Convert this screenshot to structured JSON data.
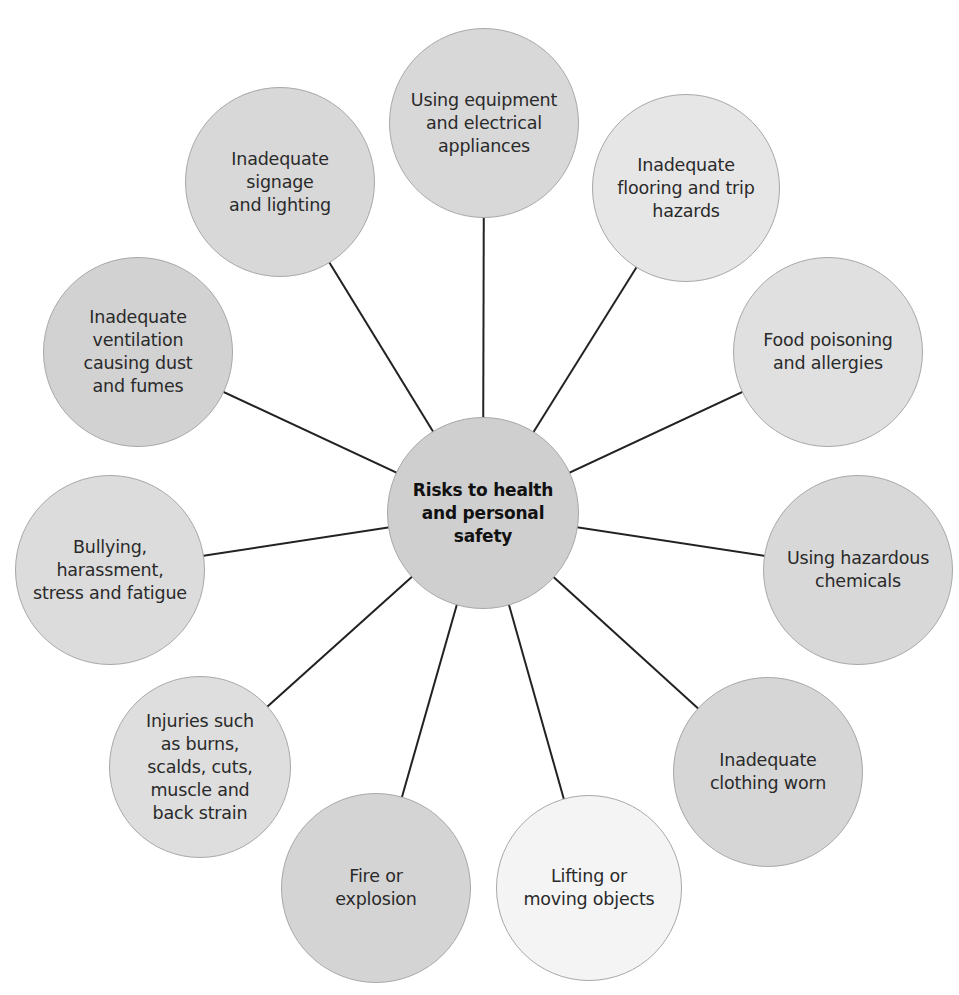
{
  "diagram": {
    "title": "Risks to health and personal safety",
    "center": {
      "label": "Risks to health\nand personal\nsafety",
      "x": 483,
      "y": 513,
      "r": 96,
      "fill": "#cfcfcf"
    },
    "line_color": "#222222",
    "nodes": [
      {
        "id": "equipment",
        "label": "Using equipment\nand electrical\nappliances",
        "x": 484,
        "y": 123,
        "r": 95,
        "fill": "#d8d8d8"
      },
      {
        "id": "flooring",
        "label": "Inadequate\nflooring and trip\nhazards",
        "x": 686,
        "y": 188,
        "r": 94,
        "fill": "#e6e6e6"
      },
      {
        "id": "food",
        "label": "Food poisoning\nand allergies",
        "x": 828,
        "y": 352,
        "r": 95,
        "fill": "#e0e0e0"
      },
      {
        "id": "chemicals",
        "label": "Using hazardous\nchemicals",
        "x": 858,
        "y": 570,
        "r": 95,
        "fill": "#d8d8d8"
      },
      {
        "id": "clothing",
        "label": "Inadequate\nclothing worn",
        "x": 768,
        "y": 772,
        "r": 95,
        "fill": "#d6d6d6"
      },
      {
        "id": "lifting",
        "label": "Lifting or\nmoving objects",
        "x": 589,
        "y": 888,
        "r": 93,
        "fill": "#f4f4f4"
      },
      {
        "id": "fire",
        "label": "Fire or\nexplosion",
        "x": 376,
        "y": 888,
        "r": 95,
        "fill": "#d4d4d4"
      },
      {
        "id": "injuries",
        "label": "Injuries such\nas burns,\nscalds, cuts,\nmuscle and\nback strain",
        "x": 200,
        "y": 767,
        "r": 91,
        "fill": "#dedede"
      },
      {
        "id": "bullying",
        "label": "Bullying,\nharassment,\nstress and fatigue",
        "x": 110,
        "y": 570,
        "r": 95,
        "fill": "#dcdcdc"
      },
      {
        "id": "ventilation",
        "label": "Inadequate\nventilation\ncausing dust\nand fumes",
        "x": 138,
        "y": 352,
        "r": 95,
        "fill": "#d2d2d2"
      },
      {
        "id": "signage",
        "label": "Inadequate\nsignage\nand lighting",
        "x": 280,
        "y": 182,
        "r": 95,
        "fill": "#d8d8d8"
      }
    ]
  }
}
